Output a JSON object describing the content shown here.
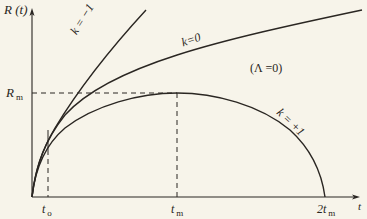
{
  "figure": {
    "type": "diagram",
    "y_axis_label": "R (t)",
    "x_axis_label": "t",
    "condition_label": "(Λ =0)",
    "curves": [
      {
        "id": "k-minus-1",
        "label": "k = −1",
        "behavior": "open, fastest expansion"
      },
      {
        "id": "k-zero",
        "label": "k=0",
        "behavior": "flat, expands forever"
      },
      {
        "id": "k-plus-1",
        "label": "k = +1",
        "behavior": "closed, reaches maximum then recollapses"
      }
    ],
    "annotations": {
      "r_max": {
        "label": "R",
        "sub": "m"
      },
      "t_0": {
        "label": "t",
        "sub": "o"
      },
      "t_max": {
        "label": "t",
        "sub": "m"
      },
      "t_2max": {
        "label": "2t",
        "sub": "m"
      }
    },
    "colors": {
      "background": "#f7f4ea",
      "ink": "#2a2622"
    }
  }
}
